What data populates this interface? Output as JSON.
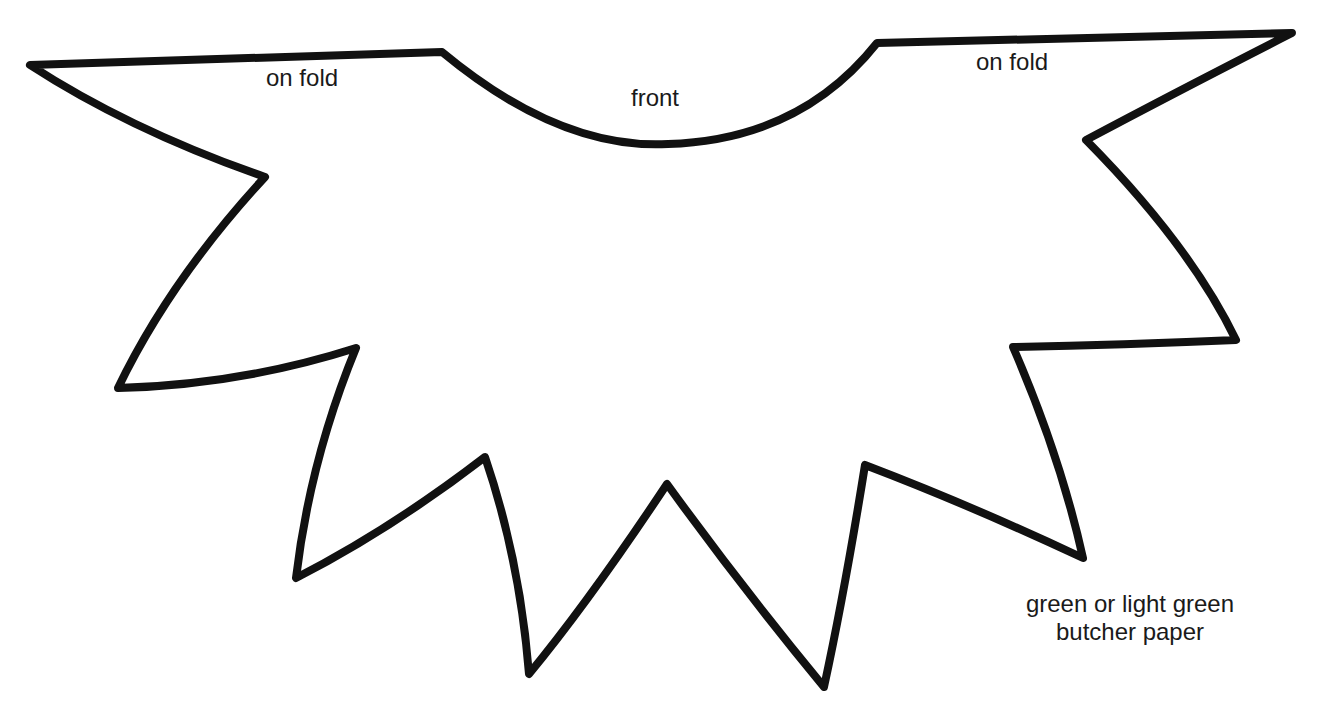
{
  "diagram": {
    "type": "craft-pattern",
    "shape": "jagged leaf collar pattern",
    "stroke_color": "#111111",
    "fill_color": "#ffffff",
    "stroke_width": 8,
    "outline_path": "M 30 65 L 442 52 Q 560 150 668 144 Q 800 140 877 43 L 1292 33 Q 1180 90 1086 140 Q 1190 245 1236 340 Q 1120 345 1013 347 Q 1060 455 1083 558 Q 970 505 865 465 Q 845 590 824 687 Q 740 585 667 484 Q 590 600 529 674 Q 520 560 485 457 Q 390 530 296 578 Q 310 460 356 348 Q 240 385 118 388 Q 170 280 265 177 Q 130 130 30 65 Z",
    "labels": {
      "fold_left": "on fold",
      "front": "front",
      "fold_right": "on fold",
      "material_line1": "green or light green",
      "material_line2": "butcher paper"
    }
  }
}
